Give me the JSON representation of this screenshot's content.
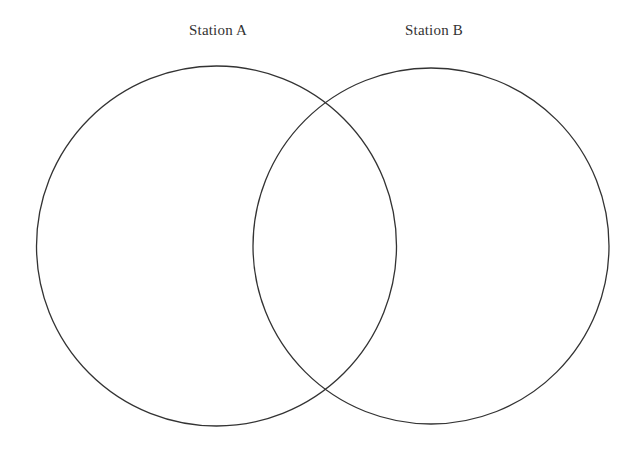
{
  "diagram": {
    "type": "venn",
    "stroke_color": "#333333",
    "background": "#ffffff",
    "sets": [
      {
        "label": "Station A",
        "circle": {
          "cx": 216.5,
          "cy": 246,
          "r": 180
        },
        "label_x": 218
      },
      {
        "label": "Station B",
        "circle": {
          "cx": 431,
          "cy": 246,
          "r": 178
        },
        "label_x": 434
      }
    ],
    "regions": {
      "only_a": "",
      "intersection": "",
      "only_b": ""
    }
  }
}
